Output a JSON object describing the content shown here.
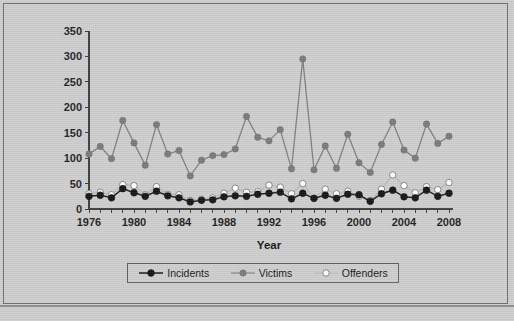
{
  "figure": {
    "frame_border_color": "#6e6e6e",
    "background_color": "#cdcdcd"
  },
  "axis": {
    "x_title": "Year",
    "y_ticks": [
      "0",
      "50",
      "100",
      "150",
      "200",
      "250",
      "300",
      "350"
    ],
    "x_ticks": [
      "1976",
      "1980",
      "1984",
      "1988",
      "1992",
      "1996",
      "2000",
      "2004",
      "2008"
    ]
  },
  "legend": {
    "items": [
      {
        "label": "Incidents",
        "color": "#111111",
        "line_color": "#1a1a1a"
      },
      {
        "label": "Victims",
        "color": "#787878",
        "line_color": "#7d7d7d"
      },
      {
        "label": "Offenders",
        "color": "#ffffff",
        "line_color": "#b6b6b6"
      }
    ]
  },
  "chart_data": {
    "type": "line",
    "title": "",
    "xlabel": "Year",
    "ylabel": "",
    "xlim": [
      1976,
      2008
    ],
    "ylim": [
      0,
      350
    ],
    "grid": false,
    "legend_position": "bottom",
    "x": [
      1976,
      1977,
      1978,
      1979,
      1980,
      1981,
      1982,
      1983,
      1984,
      1985,
      1986,
      1987,
      1988,
      1989,
      1990,
      1991,
      1992,
      1993,
      1994,
      1995,
      1996,
      1997,
      1998,
      1999,
      2000,
      2001,
      2002,
      2003,
      2004,
      2005,
      2006,
      2007,
      2008
    ],
    "categories": [
      "1976",
      "1977",
      "1978",
      "1979",
      "1980",
      "1981",
      "1982",
      "1983",
      "1984",
      "1985",
      "1986",
      "1987",
      "1988",
      "1989",
      "1990",
      "1991",
      "1992",
      "1993",
      "1994",
      "1995",
      "1996",
      "1997",
      "1998",
      "1999",
      "2000",
      "2001",
      "2002",
      "2003",
      "2004",
      "2005",
      "2006",
      "2007",
      "2008"
    ],
    "series": [
      {
        "name": "Incidents",
        "color": "#111111",
        "values": [
          25,
          27,
          22,
          40,
          32,
          25,
          35,
          26,
          22,
          14,
          17,
          18,
          24,
          26,
          25,
          29,
          31,
          33,
          20,
          31,
          21,
          27,
          21,
          29,
          28,
          15,
          30,
          37,
          24,
          22,
          37,
          25,
          31
        ]
      },
      {
        "name": "Victims",
        "color": "#787878",
        "values": [
          108,
          123,
          99,
          174,
          130,
          86,
          166,
          108,
          115,
          65,
          96,
          105,
          107,
          118,
          182,
          141,
          134,
          156,
          79,
          295,
          77,
          124,
          80,
          147,
          91,
          72,
          127,
          171,
          116,
          100,
          167,
          129,
          143
        ]
      },
      {
        "name": "Offenders",
        "color": "#ffffff",
        "values": [
          30,
          33,
          28,
          48,
          46,
          28,
          44,
          29,
          28,
          17,
          19,
          22,
          31,
          41,
          33,
          34,
          47,
          43,
          30,
          50,
          21,
          39,
          30,
          35,
          25,
          17,
          39,
          67,
          46,
          32,
          44,
          38,
          52
        ]
      }
    ]
  }
}
